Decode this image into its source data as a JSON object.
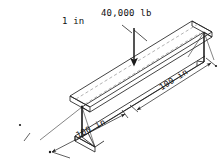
{
  "figure": {
    "name": "isometric-i-beam-point-load-diagram",
    "type": "engineering-drawing",
    "background_color": "#ffffff",
    "line_color": "#222222",
    "hidden_line_color": "#9a9a9a",
    "text_color": "#111111"
  },
  "labels": {
    "load": "40,000 lb",
    "offset": "1 in",
    "length_right": "100 in",
    "length_left": "100 in"
  },
  "annotations": {
    "load_arrow": "downward-point-load-arrow",
    "offset_leader": "leader-line-to-load-point",
    "centerline": "top-flange-dashed-centerline",
    "dimension_right": "dimension-line-right-half-span",
    "dimension_left": "dimension-line-left-half-span"
  },
  "geometry": {
    "member": "wide-flange-i-beam",
    "view": "isometric",
    "total_span_in": 200,
    "half_span_in": 100,
    "load_magnitude_lb": 40000,
    "load_eccentricity_in": 1
  }
}
